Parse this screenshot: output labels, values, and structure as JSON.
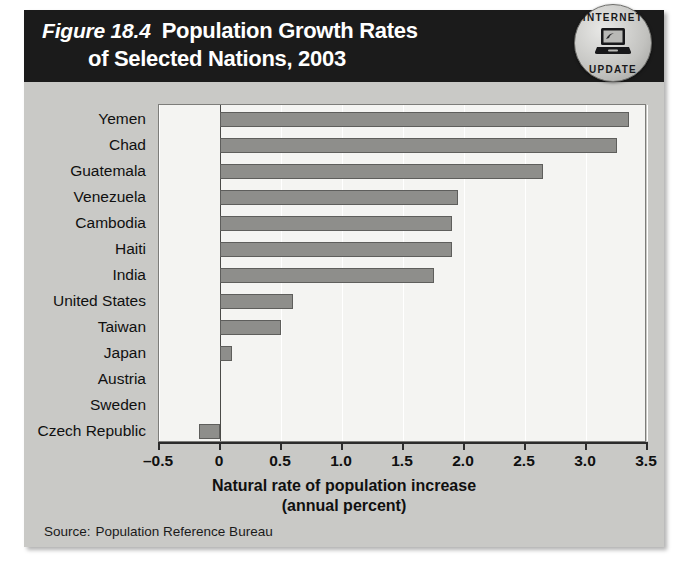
{
  "figure": {
    "number": "Figure 18.4",
    "title_line_1": "Population Growth Rates",
    "title_line_2": "of Selected Nations, 2003",
    "badge": {
      "word_top": "INTERNET",
      "word_bottom": "UPDATE",
      "icon": "computer-icon"
    },
    "source_label": "Source:",
    "source_value": "Population Reference Bureau"
  },
  "colors": {
    "header_bg": "#1b1b1b",
    "figure_bg": "#c9c9c6",
    "plot_bg": "#f4f4f2",
    "bar_fill": "#8e8e8b",
    "bar_stroke": "#5e5e5c",
    "axis": "#2b2b2b",
    "gridline": "#ffffff"
  },
  "chart_data": {
    "type": "bar",
    "orientation": "horizontal",
    "title": "Population Growth Rates of Selected Nations, 2003",
    "xlabel": "Natural rate of population increase (annual percent)",
    "xlabel_line_1": "Natural rate of population increase",
    "xlabel_line_2": "(annual percent)",
    "ylabel": "",
    "categories": [
      "Yemen",
      "Chad",
      "Guatemala",
      "Venezuela",
      "Cambodia",
      "Haiti",
      "India",
      "United States",
      "Taiwan",
      "Japan",
      "Austria",
      "Sweden",
      "Czech Republic"
    ],
    "values": [
      3.35,
      3.25,
      2.65,
      1.95,
      1.9,
      1.9,
      1.75,
      0.6,
      0.5,
      0.1,
      0.0,
      0.0,
      -0.17
    ],
    "xlim": [
      -0.5,
      3.5
    ],
    "xticks": [
      -0.5,
      0,
      0.5,
      1.0,
      1.5,
      2.0,
      2.5,
      3.0,
      3.5
    ],
    "xticklabels": [
      "–0.5",
      "0",
      "0.5",
      "1.0",
      "1.5",
      "2.0",
      "2.5",
      "3.0",
      "3.5"
    ],
    "grid": true,
    "grid_axis": "x",
    "legend": false,
    "source": "Population Reference Bureau"
  }
}
